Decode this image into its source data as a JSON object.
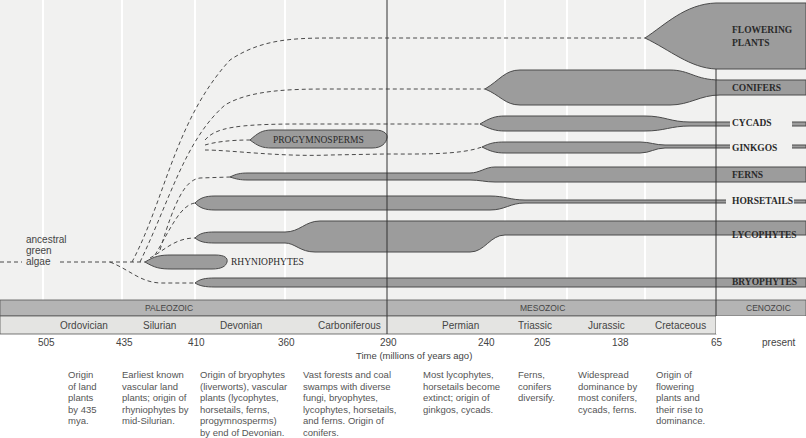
{
  "diagram": {
    "type": "evolutionary-timeline",
    "root_label_lines": [
      "ancestral",
      "green",
      "algae"
    ],
    "lineages": [
      {
        "id": "flowering",
        "label_lines": [
          "FLOWERING",
          "PLANTS"
        ]
      },
      {
        "id": "conifers",
        "label": "CONIFERS"
      },
      {
        "id": "cycads",
        "label": "CYCADS"
      },
      {
        "id": "ginkgos",
        "label": "GINKGOS"
      },
      {
        "id": "progymnosperms",
        "label": "PROGYMNOSPERMS"
      },
      {
        "id": "ferns",
        "label": "FERNS"
      },
      {
        "id": "horsetails",
        "label": "HORSETAILS"
      },
      {
        "id": "lycophytes",
        "label": "LYCOPHYTES"
      },
      {
        "id": "rhyniophytes",
        "label": "RHYNIOPHYTES"
      },
      {
        "id": "bryophytes",
        "label": "BRYOPHYTES"
      }
    ],
    "eras": [
      {
        "label": "PALEOZOIC"
      },
      {
        "label": "MESOZOIC"
      },
      {
        "label": "CENOZOIC"
      }
    ],
    "periods": [
      "Ordovician",
      "Silurian",
      "Devonian",
      "Carboniferous",
      "Permian",
      "Triassic",
      "Jurassic",
      "Cretaceous"
    ],
    "ticks": [
      "505",
      "435",
      "410",
      "360",
      "290",
      "240",
      "205",
      "138",
      "65",
      "present"
    ],
    "axis_title": "Time (millions of years ago)",
    "notes": [
      {
        "lines": [
          "Origin",
          "of land",
          "plants",
          "by 435",
          "mya."
        ]
      },
      {
        "lines": [
          "Earliest known",
          "vascular land",
          "plants; origin of",
          "rhyniophytes by",
          "mid-Silurian."
        ]
      },
      {
        "lines": [
          "Origin of bryophytes",
          "(liverworts), vascular",
          "plants (lycophytes,",
          "horsetails, ferns,",
          "progymnosperms)",
          "by end of Devonian."
        ]
      },
      {
        "lines": [
          "Vast forests and coal",
          "swamps with diverse",
          "fungi, bryophytes,",
          "lycophytes, horsetails,",
          "and ferns. Origin of",
          "conifers."
        ]
      },
      {
        "lines": [
          "Most lycophytes,",
          "horsetails become",
          "extinct; origin of",
          "ginkgos, cycads."
        ]
      },
      {
        "lines": [
          "Ferns,",
          "conifers",
          "diversify."
        ]
      },
      {
        "lines": [
          "Widespread",
          "dominance by",
          "most conifers,",
          "cycads, ferns."
        ]
      },
      {
        "lines": [
          "Origin of",
          "flowering",
          "plants and",
          "their rise to",
          "dominance."
        ]
      }
    ],
    "colors": {
      "background": "#f1f1f0",
      "band_fill": "#9c9c9c",
      "band_stroke": "#4a4a4a",
      "era_bar": "#b4b4b4",
      "period_bar": "#e4e4e2",
      "text": "#2a2a2a"
    }
  }
}
